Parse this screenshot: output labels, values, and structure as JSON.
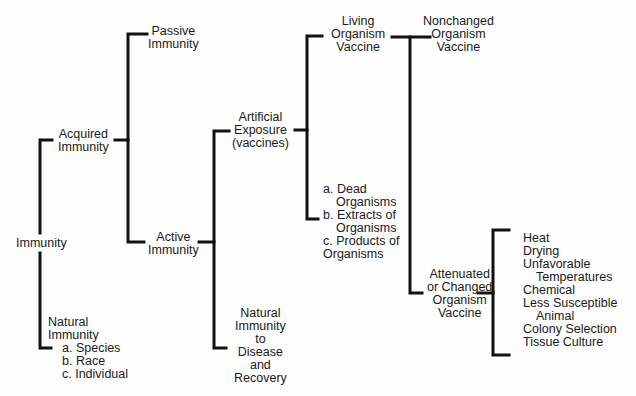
{
  "diagram": {
    "nodes": {
      "immunity": "Immunity",
      "acquired": [
        "Acquired",
        "Immunity"
      ],
      "natural": {
        "lines": [
          "Natural",
          "Immunity"
        ],
        "items": [
          "a. Species",
          "b. Race",
          "c. Individual"
        ]
      },
      "passive": [
        "Passive",
        "Immunity"
      ],
      "active": [
        "Active",
        "Immunity"
      ],
      "artificial": [
        "Artificial",
        "Exposure",
        "(vaccines)"
      ],
      "natural_disease": [
        "Natural",
        "Immunity",
        "to",
        "Disease",
        "and",
        "Recovery"
      ],
      "living": [
        "Living",
        "Organism",
        "Vaccine"
      ],
      "dead": {
        "items": [
          "a. Dead",
          "Organisms",
          "b. Extracts of",
          "Organisms",
          "c. Products of",
          "Organisms"
        ]
      },
      "nonchanged": [
        "Nonchanged",
        "Organism",
        "Vaccine"
      ],
      "attenuated": [
        "Attenuated",
        "or Changed",
        "Organism",
        "Vaccine"
      ],
      "methods": [
        "Heat",
        "Drying",
        "Unfavorable",
        "Temperatures",
        "Chemical",
        "Less Susceptible",
        "Animal",
        "Colony Selection",
        "Tissue Culture"
      ]
    },
    "line_color": "#111111"
  }
}
